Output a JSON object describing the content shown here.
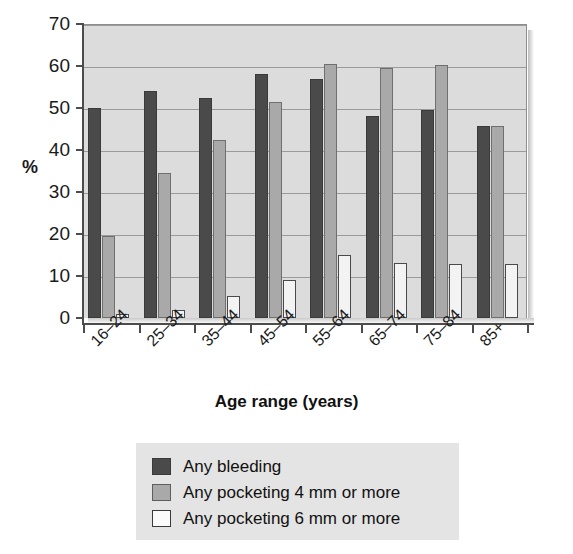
{
  "chart_data": {
    "type": "bar",
    "title": "",
    "xlabel": "Age range (years)",
    "ylabel": "%",
    "categories": [
      "16–24",
      "25–34",
      "35–44",
      "45–54",
      "55–64",
      "65–74",
      "75–84",
      "85+"
    ],
    "series": [
      {
        "name": "Any bleeding",
        "color": "#4a4a4a",
        "values": [
          50,
          54,
          52.5,
          58,
          57,
          48,
          49.5,
          45.8
        ]
      },
      {
        "name": "Any pocketing 4 mm or more",
        "color": "#a9a9a9",
        "values": [
          19.5,
          34.5,
          42.3,
          51.5,
          60.5,
          59.5,
          60.3,
          45.8
        ]
      },
      {
        "name": "Any pocketing 6 mm or more",
        "color": "#f3f3f3",
        "values": [
          1,
          2,
          5.3,
          9,
          15,
          13,
          12.8,
          12.8
        ]
      }
    ],
    "ylim": [
      0,
      70
    ],
    "ytick_labels": [
      "0",
      "10",
      "20",
      "30",
      "40",
      "50",
      "60",
      "70"
    ],
    "ytick_values": [
      0,
      10,
      20,
      30,
      40,
      50,
      60,
      70
    ],
    "grid": true,
    "legend_position": "bottom-center",
    "plot_background": "#dcdcdc"
  },
  "legend": {
    "items": [
      {
        "label": "Any bleeding"
      },
      {
        "label": "Any pocketing 4 mm or more"
      },
      {
        "label": "Any pocketing 6 mm or more"
      }
    ]
  }
}
